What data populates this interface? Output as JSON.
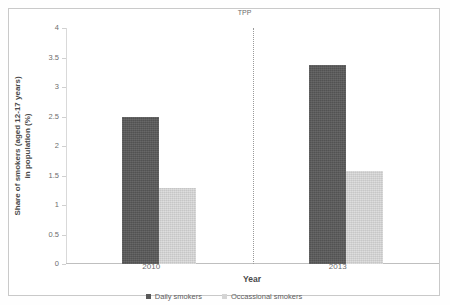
{
  "chart_data": {
    "type": "bar",
    "title": "",
    "categories": [
      "2010",
      "2013"
    ],
    "series": [
      {
        "name": "Daily smokers",
        "values": [
          2.5,
          3.37
        ],
        "color": "#595959"
      },
      {
        "name": "Occassional smokers",
        "values": [
          1.28,
          1.58
        ],
        "color": "#d5d5d5"
      }
    ],
    "xlabel": "Year",
    "ylabel": "Share of smokers (aged 12-17 years) in population (%)",
    "ylim": [
      0,
      4
    ],
    "yticks": [
      "0",
      "0.5",
      "1",
      "1.5",
      "2",
      "2.5",
      "3",
      "3.5",
      "4"
    ],
    "ytick_values": [
      0,
      0.5,
      1,
      1.5,
      2,
      2.5,
      3,
      3.5,
      4
    ],
    "grid": false,
    "legend_position": "bottom",
    "annotations": [
      {
        "text": "TPP",
        "type": "vertical-dotted-line",
        "between_categories": [
          "2010",
          "2013"
        ]
      }
    ]
  },
  "axes": {
    "y_title": "Share of smokers (aged 12-17 years) in population (%)",
    "y_title_line1": "Share of smokers (aged 12-17 years)",
    "y_title_line2": "in population (%)",
    "x_title": "Year"
  },
  "annotation": {
    "tpp_label": "TPP"
  },
  "legend": {
    "items": [
      {
        "label": "Daily smokers",
        "color": "#595959"
      },
      {
        "label": "Occassional smokers",
        "color": "#d5d5d5"
      }
    ]
  }
}
